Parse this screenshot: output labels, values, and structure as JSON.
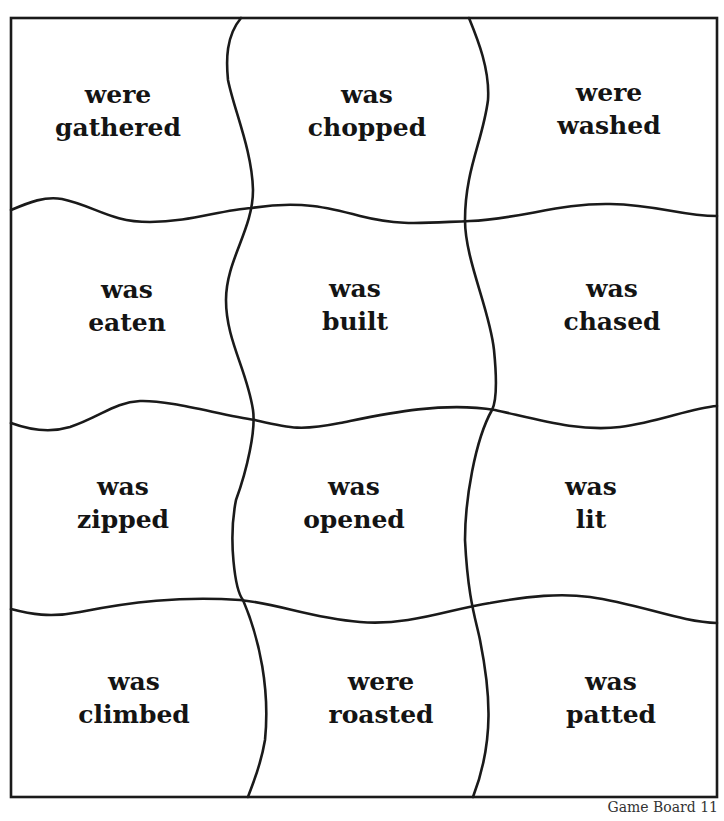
{
  "board": {
    "border_color": "#1a1a1a",
    "cells": [
      {
        "row": 0,
        "col": 0,
        "line1": "were",
        "line2": "gathered",
        "x": 118,
        "y": 111
      },
      {
        "row": 0,
        "col": 1,
        "line1": "was",
        "line2": "chopped",
        "x": 367,
        "y": 111
      },
      {
        "row": 0,
        "col": 2,
        "line1": "were",
        "line2": "washed",
        "x": 609,
        "y": 109
      },
      {
        "row": 1,
        "col": 0,
        "line1": "was",
        "line2": "eaten",
        "x": 127,
        "y": 306
      },
      {
        "row": 1,
        "col": 1,
        "line1": "was",
        "line2": "built",
        "x": 355,
        "y": 305
      },
      {
        "row": 1,
        "col": 2,
        "line1": "was",
        "line2": "chased",
        "x": 612,
        "y": 305
      },
      {
        "row": 2,
        "col": 0,
        "line1": "was",
        "line2": "zipped",
        "x": 123,
        "y": 503
      },
      {
        "row": 2,
        "col": 1,
        "line1": "was",
        "line2": "opened",
        "x": 354,
        "y": 503
      },
      {
        "row": 2,
        "col": 2,
        "line1": "was",
        "line2": "lit",
        "x": 591,
        "y": 503
      },
      {
        "row": 3,
        "col": 0,
        "line1": "was",
        "line2": "climbed",
        "x": 134,
        "y": 698
      },
      {
        "row": 3,
        "col": 1,
        "line1": "were",
        "line2": "roasted",
        "x": 381,
        "y": 698
      },
      {
        "row": 3,
        "col": 2,
        "line1": "was",
        "line2": "patted",
        "x": 611,
        "y": 698
      }
    ]
  },
  "footer": {
    "label": "Game Board 11"
  }
}
